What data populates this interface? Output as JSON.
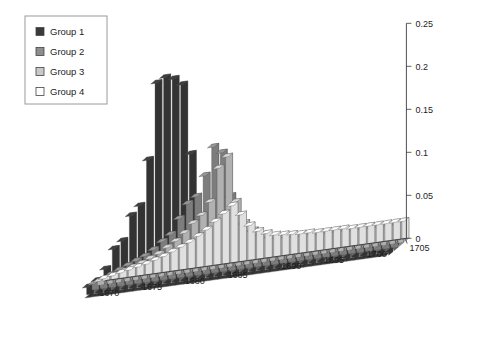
{
  "legend": {
    "name": "chart-legend",
    "items": [
      {
        "label": "Group 1",
        "color": "#3a3a3a"
      },
      {
        "label": "Group 2",
        "color": "#8e8e8e"
      },
      {
        "label": "Group 3",
        "color": "#c9c9c9"
      },
      {
        "label": "Group 4",
        "color": "#ffffff"
      }
    ]
  },
  "axes": {
    "z_ticks": [
      "0",
      "0.05",
      "0.1",
      "0.15",
      "0.2",
      "0.25"
    ],
    "x_front_ticks": [
      "1670",
      "1675",
      "1680",
      "1685"
    ],
    "x_right_ticks": [
      "1690",
      "1695",
      "1700",
      "1705"
    ]
  },
  "chart_data": {
    "type": "bar",
    "title": "",
    "xlabel": "",
    "ylabel": "",
    "zlabel": "",
    "projection": "3d-ribbon",
    "grid": false,
    "legend_position": "top-left",
    "zlim": [
      0,
      0.25
    ],
    "ztick_step": 0.05,
    "categories": [
      1670,
      1671,
      1672,
      1673,
      1674,
      1675,
      1676,
      1677,
      1678,
      1679,
      1680,
      1681,
      1682,
      1683,
      1684,
      1685,
      1686,
      1687,
      1688,
      1689,
      1690,
      1691,
      1692,
      1693,
      1694,
      1695,
      1696,
      1697,
      1698,
      1699,
      1700,
      1701,
      1702,
      1703,
      1704,
      1705
    ],
    "series": [
      {
        "name": "Group 1",
        "color": "#3a3a3a",
        "values": [
          0.012,
          0.018,
          0.03,
          0.052,
          0.06,
          0.088,
          0.098,
          0.15,
          0.238,
          0.243,
          0.24,
          0.232,
          0.15,
          0.052,
          0.04,
          0.038,
          0.036,
          0.034,
          0.033,
          0.032,
          0.031,
          0.03,
          0.03,
          0.03,
          0.03,
          0.03,
          0.03,
          0.029,
          0.029,
          0.029,
          0.029,
          0.028,
          0.028,
          0.028,
          0.028,
          0.028
        ]
      },
      {
        "name": "Group 2",
        "color": "#8e8e8e",
        "values": [
          0.01,
          0.014,
          0.018,
          0.022,
          0.026,
          0.03,
          0.034,
          0.04,
          0.048,
          0.055,
          0.072,
          0.088,
          0.095,
          0.118,
          0.15,
          0.142,
          0.09,
          0.062,
          0.048,
          0.04,
          0.036,
          0.034,
          0.032,
          0.031,
          0.03,
          0.03,
          0.03,
          0.029,
          0.029,
          0.029,
          0.029,
          0.028,
          0.028,
          0.028,
          0.028,
          0.028
        ]
      },
      {
        "name": "Group 3",
        "color": "#c9c9c9",
        "values": [
          0.008,
          0.01,
          0.013,
          0.016,
          0.019,
          0.022,
          0.026,
          0.03,
          0.036,
          0.042,
          0.05,
          0.06,
          0.068,
          0.082,
          0.12,
          0.132,
          0.078,
          0.052,
          0.042,
          0.036,
          0.032,
          0.03,
          0.029,
          0.028,
          0.028,
          0.028,
          0.027,
          0.027,
          0.027,
          0.027,
          0.026,
          0.026,
          0.026,
          0.026,
          0.026,
          0.026
        ]
      },
      {
        "name": "Group 4",
        "color": "#ffffff",
        "values": [
          0.006,
          0.008,
          0.01,
          0.012,
          0.014,
          0.016,
          0.019,
          0.022,
          0.026,
          0.03,
          0.034,
          0.04,
          0.046,
          0.054,
          0.062,
          0.07,
          0.058,
          0.044,
          0.036,
          0.032,
          0.029,
          0.028,
          0.027,
          0.026,
          0.026,
          0.025,
          0.025,
          0.025,
          0.025,
          0.024,
          0.024,
          0.024,
          0.024,
          0.024,
          0.024,
          0.024
        ]
      }
    ]
  }
}
